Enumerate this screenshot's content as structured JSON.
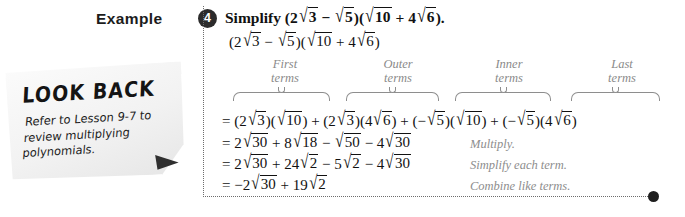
{
  "example": {
    "label": "Example",
    "number": "4"
  },
  "problem": {
    "title_prefix": "Simplify ",
    "title_suffix": ".",
    "expression_parts": {
      "two": "2",
      "three": "3",
      "five": "5",
      "ten": "10",
      "four": "4",
      "six": "6"
    }
  },
  "foil": {
    "labels": [
      {
        "line1": "First",
        "line2": "terms"
      },
      {
        "line1": "Outer",
        "line2": "terms"
      },
      {
        "line1": "Inner",
        "line2": "terms"
      },
      {
        "line1": "Last",
        "line2": "terms"
      }
    ]
  },
  "steps": [
    {
      "note": ""
    },
    {
      "note": "Multiply."
    },
    {
      "note": "Simplify each term."
    },
    {
      "note": "Combine like terms."
    }
  ],
  "numbers": {
    "n2": "2",
    "n3": "3",
    "n4": "4",
    "n5": "5",
    "n6": "6",
    "n8": "8",
    "n10": "10",
    "n18": "18",
    "n19": "19",
    "n24": "24",
    "n30": "30",
    "n50": "50",
    "neg2": "−2",
    "minus": "−",
    "plus": "+",
    "equals": "=",
    "lparen": "(",
    "rparen": ")"
  },
  "lookback": {
    "title": "LOOK BACK",
    "body": "Refer to Lesson 9-7 to review multiplying polynomials."
  },
  "colors": {
    "ink": "#111111",
    "gray_annotation": "#8d8d8d",
    "badge": "#2b2b2b",
    "rule": "#6d6d6d"
  }
}
